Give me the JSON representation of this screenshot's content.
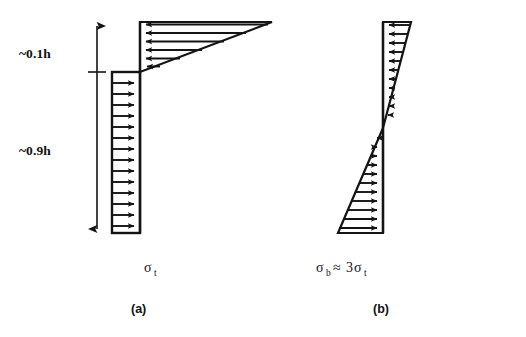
{
  "figure": {
    "background_color": "#ffffff",
    "ink_color": "#141414",
    "width": 526,
    "height": 337
  },
  "dimension_labels": {
    "upper": "~0.1h",
    "lower": "~0.9h"
  },
  "panels": [
    {
      "id": "a",
      "caption": "(a)",
      "stress_symbol": "σ",
      "stress_subscript": "t",
      "stress_relation": "",
      "description": "uniform tensile block over lower 0.9h with triangular peak over upper 0.1h",
      "upper_shape": "triangle",
      "lower_shape": "rectangle",
      "upper_arrow_count": 6,
      "lower_arrow_count": 14,
      "arrow_direction_upper": "left",
      "arrow_direction_lower": "right"
    },
    {
      "id": "b",
      "caption": "(b)",
      "stress_symbol": "σ",
      "stress_subscript": "b",
      "stress_relation": "≈ 3σ",
      "stress_relation_subscript": "t",
      "description": "linear bending distribution, zero at neutral axis, reversing sign",
      "upper_shape": "triangle",
      "lower_shape": "triangle",
      "upper_arrow_count": 11,
      "lower_arrow_count": 11,
      "arrow_direction_upper": "left",
      "arrow_direction_lower": "right"
    }
  ],
  "stress_label_a": {
    "symbol": "σ",
    "subscript": "t"
  },
  "stress_label_b": {
    "symbol": "σ",
    "subscript": "b",
    "approx": "≈",
    "factor": "3",
    "symbol2": "σ",
    "subscript2": "t"
  },
  "captions": {
    "a": "(a)",
    "b": "(b)"
  },
  "geometry": {
    "dimension_arrow_x": 97,
    "dimension_arrow_top_y": 22,
    "dimension_arrow_bottom_y": 233,
    "dimension_tick_y": 72,
    "panel_a_spine_x": 140,
    "panel_a_top_y": 22,
    "panel_a_neutral_y": 72,
    "panel_a_bottom_y": 233,
    "panel_a_rect_left_x": 112,
    "panel_a_tri_apex_x": 272,
    "panel_b_spine_x": 383,
    "panel_b_top_y": 22,
    "panel_b_neutral_y": 128,
    "panel_b_bottom_y": 233,
    "panel_b_upper_right_x": 411,
    "panel_b_lower_left_x": 338
  }
}
